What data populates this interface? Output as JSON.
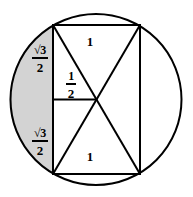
{
  "figure": {
    "name": "circle-with-inscribed-rectangle",
    "title": "",
    "colors": {
      "stroke": "#000000",
      "shaded_segment_fill": "#d3d3d3",
      "background": "#ffffff"
    },
    "circle": {
      "center_x": 96,
      "center_y": 99.5,
      "radius": 85.5
    },
    "rectangle": {
      "left": 53,
      "top": 25,
      "right": 140,
      "bottom": 174,
      "width_label": "1",
      "height_label": "√3"
    },
    "labels": {
      "sqrt3_over_2_top": {
        "numerator": "√3",
        "denominator": "2"
      },
      "sqrt3_over_2_bottom": {
        "numerator": "√3",
        "denominator": "2"
      },
      "one_half": {
        "numerator": "1",
        "denominator": "2"
      },
      "one_top": "1",
      "one_bottom": "1"
    },
    "shaded_region": {
      "description": "circular-segment-left",
      "fill": "#d3d3d3"
    }
  }
}
